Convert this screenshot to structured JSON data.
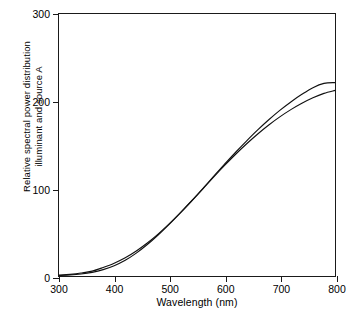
{
  "chart_data": {
    "type": "line",
    "title": "",
    "xlabel": "Wavelength (nm)",
    "ylabel_line1": "Relative spectral power distribution",
    "ylabel_line2": "illuminant and source A",
    "xlim": [
      300,
      800
    ],
    "ylim": [
      0,
      300
    ],
    "xticks": [
      300,
      400,
      500,
      600,
      700,
      800
    ],
    "yticks": [
      0,
      100,
      200,
      300
    ],
    "grid": false,
    "legend": null,
    "line_color": "#111111",
    "x": [
      300,
      320,
      340,
      360,
      380,
      400,
      420,
      440,
      460,
      480,
      500,
      520,
      540,
      560,
      580,
      600,
      620,
      640,
      660,
      680,
      700,
      720,
      740,
      760,
      780,
      800
    ],
    "series": [
      {
        "name": "CIE standard illuminant A",
        "values": [
          0.93,
          1.9,
          3.4,
          5.6,
          9.8,
          14.7,
          20.9,
          28.7,
          37.8,
          48.2,
          59.9,
          72.5,
          85.9,
          99.8,
          114.0,
          128.0,
          141.7,
          154.8,
          167.3,
          178.9,
          189.6,
          199.3,
          208.0,
          215.6,
          220.5,
          221.5
        ]
      },
      {
        "name": "CIE source A (gas-filled tungsten lamp)",
        "values": [
          0.6,
          1.2,
          2.3,
          4.2,
          7.3,
          11.8,
          18.0,
          26.2,
          36.0,
          47.2,
          59.4,
          72.3,
          85.6,
          99.3,
          113.2,
          126.6,
          139.4,
          151.4,
          162.6,
          172.9,
          182.2,
          190.5,
          197.8,
          204.1,
          209.1,
          212.5
        ]
      }
    ]
  }
}
